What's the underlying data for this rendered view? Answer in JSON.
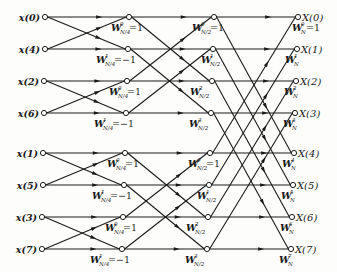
{
  "diagram": {
    "type": "fft-butterfly-flow-graph",
    "colors": {
      "line": "#1a1a1a",
      "node_fill": "#ffffff",
      "background": "#fdfdfc"
    },
    "inputs": [
      "x(0)",
      "x(4)",
      "x(2)",
      "x(6)",
      "x(1)",
      "x(5)",
      "x(3)",
      "x(7)"
    ],
    "outputs": [
      "X(0)",
      "X(1)",
      "X(2)",
      "X(3)",
      "X(4)",
      "X(5)",
      "X(6)",
      "X(7)"
    ],
    "stage1_twiddles": [
      {
        "base": "W",
        "sub": "N/4",
        "exp": "0",
        "suffix": "=1"
      },
      {
        "base": "W",
        "sub": "N/4",
        "exp": "1",
        "suffix": "=−1"
      },
      {
        "base": "W",
        "sub": "N/4",
        "exp": "0",
        "suffix": "=1"
      },
      {
        "base": "W",
        "sub": "N/4",
        "exp": "1",
        "suffix": "=−1"
      },
      {
        "base": "W",
        "sub": "N/4",
        "exp": "0",
        "suffix": "=1"
      },
      {
        "base": "W",
        "sub": "N/4",
        "exp": "1",
        "suffix": "=−1"
      },
      {
        "base": "W",
        "sub": "N/4",
        "exp": "0",
        "suffix": "=1"
      },
      {
        "base": "W",
        "sub": "N/4",
        "exp": "1",
        "suffix": "=−1"
      }
    ],
    "stage2_twiddles": [
      {
        "base": "W",
        "sub": "N/2",
        "exp": "0",
        "suffix": "=1"
      },
      {
        "base": "W",
        "sub": "N/2",
        "exp": "1",
        "suffix": ""
      },
      {
        "base": "W",
        "sub": "N/2",
        "exp": "2",
        "suffix": ""
      },
      {
        "base": "W",
        "sub": "N/2",
        "exp": "3",
        "suffix": ""
      },
      {
        "base": "W",
        "sub": "N/2",
        "exp": "0",
        "suffix": "=1"
      },
      {
        "base": "W",
        "sub": "N/2",
        "exp": "1",
        "suffix": ""
      },
      {
        "base": "W",
        "sub": "N/2",
        "exp": "2",
        "suffix": ""
      },
      {
        "base": "W",
        "sub": "N/2",
        "exp": "3",
        "suffix": ""
      }
    ],
    "stage3_twiddles": [
      {
        "base": "W",
        "sub": "N",
        "exp": "0",
        "suffix": "=1"
      },
      {
        "base": "W",
        "sub": "N",
        "exp": "1",
        "suffix": ""
      },
      {
        "base": "W",
        "sub": "N",
        "exp": "2",
        "suffix": ""
      },
      {
        "base": "W",
        "sub": "N",
        "exp": "3",
        "suffix": ""
      },
      {
        "base": "W",
        "sub": "N",
        "exp": "4",
        "suffix": ""
      },
      {
        "base": "W",
        "sub": "N",
        "exp": "5",
        "suffix": ""
      },
      {
        "base": "W",
        "sub": "N",
        "exp": "6",
        "suffix": ""
      },
      {
        "base": "W",
        "sub": "N",
        "exp": "7",
        "suffix": ""
      }
    ],
    "geometry": {
      "rows_y": [
        17,
        49,
        81,
        113,
        153,
        185,
        217,
        249
      ],
      "col_input_x": [
        45,
        45,
        44,
        44,
        43,
        43,
        42,
        42
      ],
      "col_s1_x": [
        129,
        128,
        127,
        126,
        125,
        124,
        123,
        122
      ],
      "col_s2_x": [
        214,
        213,
        212,
        211,
        210,
        209,
        208,
        207
      ],
      "col_out_x": [
        298,
        297,
        296,
        295,
        294,
        293,
        292,
        291
      ]
    }
  }
}
